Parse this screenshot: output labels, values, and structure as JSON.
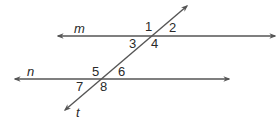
{
  "diagram": {
    "type": "parallel-lines-transversal",
    "colors": {
      "line": "#555555",
      "text": "#2a2a2a",
      "background": "#ffffff"
    },
    "lines": [
      {
        "id": "m",
        "label": "m",
        "kind": "line",
        "x1": 58,
        "y1": 36,
        "x2": 275,
        "y2": 36
      },
      {
        "id": "n",
        "label": "n",
        "kind": "line",
        "x1": 15,
        "y1": 79,
        "x2": 229,
        "y2": 79
      },
      {
        "id": "t",
        "label": "t",
        "kind": "transversal",
        "x1": 65,
        "y1": 110,
        "x2": 187,
        "y2": 6
      }
    ],
    "line_labels": {
      "m": {
        "text": "m",
        "x": 74,
        "y": 33
      },
      "n": {
        "text": "n",
        "x": 27,
        "y": 76
      },
      "t": {
        "text": "t",
        "x": 76,
        "y": 117
      }
    },
    "angles": [
      {
        "id": "1",
        "text": "1",
        "x": 145,
        "y": 31
      },
      {
        "id": "2",
        "text": "2",
        "x": 169,
        "y": 32
      },
      {
        "id": "3",
        "text": "3",
        "x": 129,
        "y": 47
      },
      {
        "id": "4",
        "text": "4",
        "x": 151,
        "y": 48
      },
      {
        "id": "5",
        "text": "5",
        "x": 92,
        "y": 76
      },
      {
        "id": "6",
        "text": "6",
        "x": 118,
        "y": 76
      },
      {
        "id": "7",
        "text": "7",
        "x": 76,
        "y": 90
      },
      {
        "id": "8",
        "text": "8",
        "x": 100,
        "y": 91
      }
    ]
  }
}
